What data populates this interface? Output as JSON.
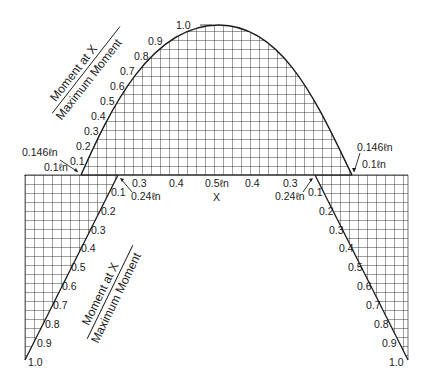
{
  "figure": {
    "title_fraction": {
      "numerator": "Moment at X",
      "denominator": "Maximum Moment"
    },
    "x_axis_label": "X",
    "colors": {
      "ink": "#1a1a1a",
      "grid": "#2a2a2a",
      "background": "#ffffff"
    }
  },
  "positive_moment": {
    "left_ticks": [
      "0.1",
      "0.2",
      "0.3",
      "0.4",
      "0.5",
      "0.6",
      "0.7",
      "0.8",
      "0.9",
      "1.0"
    ],
    "span_labels": [
      "0.3",
      "0.4",
      "0.5ℓn",
      "0.4",
      "0.3"
    ],
    "left_annotations": {
      "inflection": "0.146ℓn",
      "cutoff": "0.1ℓn"
    },
    "right_annotations": {
      "inflection": "0.146ℓn",
      "cutoff": "0.1ℓn"
    }
  },
  "negative_moment": {
    "left_ticks": [
      "0.1",
      "0.2",
      "0.3",
      "0.4",
      "0.5",
      "0.6",
      "0.7",
      "0.8",
      "0.9",
      "1.0"
    ],
    "right_ticks": [
      "0.1",
      "0.2",
      "0.3",
      "0.4",
      "0.5",
      "0.6",
      "0.7",
      "0.8",
      "0.9",
      "1.0"
    ],
    "left_annotation": "0.24ℓn",
    "right_annotation": "0.24ℓn"
  }
}
